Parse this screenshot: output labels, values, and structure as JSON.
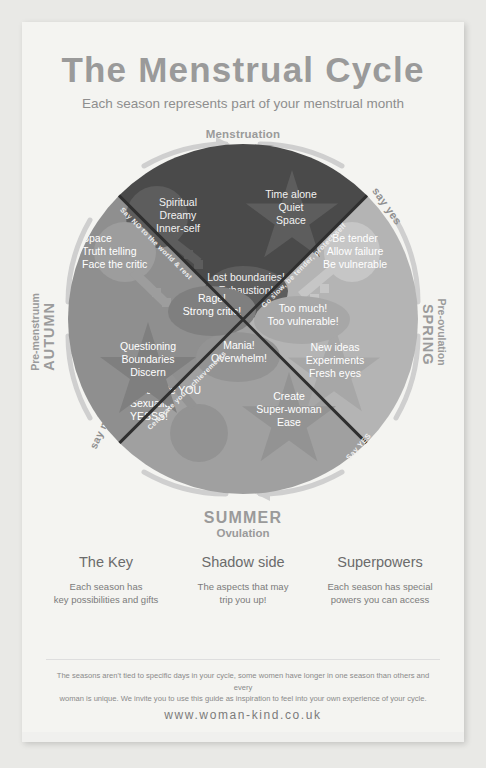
{
  "header": {
    "title": "The Menstrual Cycle",
    "subtitle": "Each season represents part of your menstrual month",
    "phase_top_small": "Menstruation",
    "phase_top_big": "WINTER"
  },
  "wheel": {
    "seasons": {
      "winter": {
        "small": "Menstruation",
        "big": "WINTER",
        "color": "#4a4a4a",
        "key": [
          "Spiritual",
          "Dreamy",
          "Inner-self"
        ],
        "star": [
          "Time alone",
          "Quiet",
          "Space"
        ],
        "shadow": [
          "Lost boundaries!",
          "Exhaustion!"
        ]
      },
      "spring": {
        "small": "Pre-ovulation",
        "big": "SPRING",
        "color": "#b4b4b4",
        "key": [
          "Be tender",
          "Allow failure",
          "Be vulnerable"
        ],
        "star": [
          "New ideas",
          "Experiments",
          "Fresh eyes"
        ],
        "shadow": [
          "Too much!",
          "Too vulnerable!"
        ]
      },
      "summer": {
        "small": "Ovulation",
        "big": "SUMMER",
        "color": "#a0a0a0",
        "key": [
          "Celebrate YOU",
          "Sexuality",
          "YESSS!"
        ],
        "star": [
          "Create",
          "Super-woman",
          "Ease"
        ],
        "shadow": [
          "Mania!",
          "Overwhelm!"
        ]
      },
      "autumn": {
        "small": "Pre-menstruum",
        "big": "AUTUMN",
        "color": "#8f8f8f",
        "key": [
          "Space",
          "Truth telling",
          "Face the critic"
        ],
        "star": [
          "Questioning",
          "Boundaries",
          "Discern"
        ],
        "shadow": [
          "Rage!",
          "Strong critic!"
        ]
      }
    },
    "diagonal_labels": {
      "winter_autumn": "Say NO to the world & rest",
      "winter_spring": "Go slow, be tender, protect self",
      "summer_autumn": "Celebrate your achievements"
    },
    "curved_labels": {
      "top_right": "say yes",
      "bottom_right": "Say YES",
      "bottom_left": "say no"
    }
  },
  "columns": [
    {
      "heading": "The Key",
      "body_line1": "Each season has",
      "body_line2": "key possibilities and gifts"
    },
    {
      "heading": "Shadow side",
      "body_line1": "The aspects that may",
      "body_line2": "trip you up!"
    },
    {
      "heading": "Superpowers",
      "body_line1": "Each season has special",
      "body_line2": "powers you can access"
    }
  ],
  "footer": {
    "disclaimer_line1": "The seasons aren't tied to specific days in your cycle, some women have longer in one season than others and every",
    "disclaimer_line2": "woman is unique. We invite you to use this guide as inspiration to feel into your own experience of your cycle.",
    "url": "www.woman-kind.co.uk"
  }
}
